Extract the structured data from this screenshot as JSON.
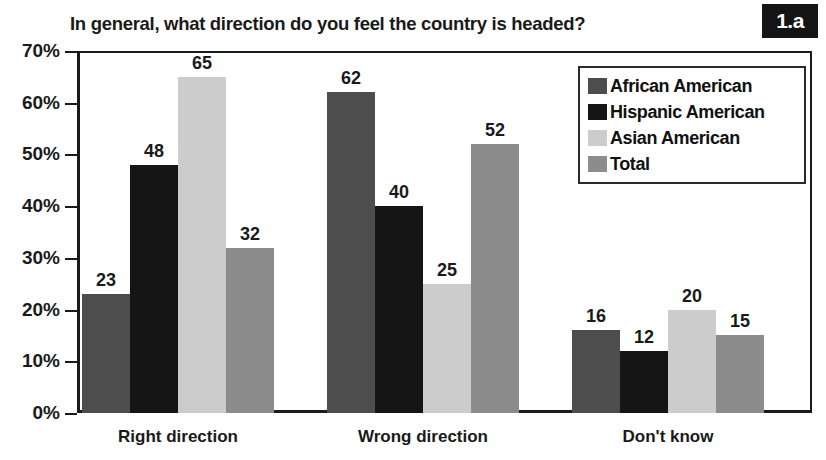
{
  "title": "In general, what direction do you feel the country is headed?",
  "badge": "1.a",
  "legend": {
    "position": "top-right",
    "entries": [
      {
        "label": "African American",
        "color": "#4d4d4d"
      },
      {
        "label": "Hispanic American",
        "color": "#151515"
      },
      {
        "label": "Asian American",
        "color": "#cccccc"
      },
      {
        "label": "Total",
        "color": "#8c8c8c"
      }
    ]
  },
  "axis": {
    "y_ticks": [
      "0%",
      "10%",
      "20%",
      "30%",
      "40%",
      "50%",
      "60%",
      "70%"
    ],
    "x_categories": [
      "Right direction",
      "Wrong direction",
      "Don't know"
    ]
  },
  "chart_data": {
    "type": "bar",
    "title": "In general, what direction do you feel the country is headed?",
    "xlabel": "",
    "ylabel": "",
    "ylim": [
      0,
      70
    ],
    "ytick_values": [
      0,
      10,
      20,
      30,
      40,
      50,
      60,
      70
    ],
    "ytick_labels": [
      "0%",
      "10%",
      "20%",
      "30%",
      "40%",
      "50%",
      "60%",
      "70%"
    ],
    "grid": false,
    "legend_position": "top-right",
    "value_labels": true,
    "categories": [
      "Right direction",
      "Wrong direction",
      "Don't know"
    ],
    "series": [
      {
        "name": "African American",
        "color": "#4d4d4d",
        "values": [
          23,
          62,
          16
        ]
      },
      {
        "name": "Hispanic American",
        "color": "#151515",
        "values": [
          48,
          40,
          12
        ]
      },
      {
        "name": "Asian American",
        "color": "#cccccc",
        "values": [
          65,
          25,
          20
        ]
      },
      {
        "name": "Total",
        "color": "#8c8c8c",
        "values": [
          32,
          52,
          15
        ]
      }
    ]
  }
}
